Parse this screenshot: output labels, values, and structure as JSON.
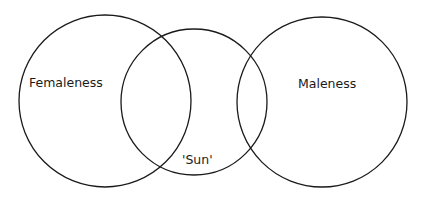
{
  "diagram": {
    "type": "venn",
    "background": "#ffffff",
    "stroke_color": "#1a1a1a",
    "sets": [
      {
        "id": "femaleness",
        "label": "Femaleness"
      },
      {
        "id": "sun",
        "label": "'Sun'"
      },
      {
        "id": "maleness",
        "label": "Maleness"
      }
    ]
  }
}
